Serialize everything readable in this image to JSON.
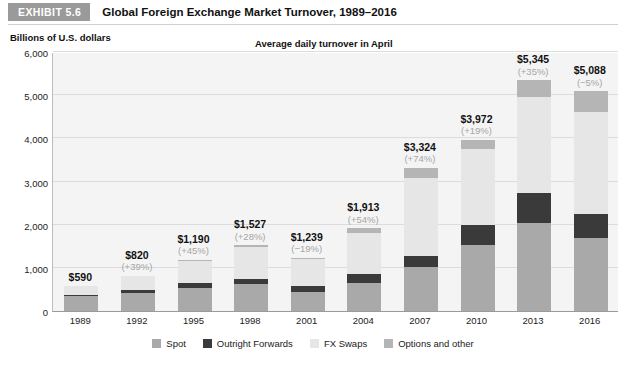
{
  "exhibit": {
    "badge": "EXHIBIT 5.6",
    "title": "Global Foreign Exchange Market Turnover, 1989–2016"
  },
  "chart_data": {
    "type": "bar",
    "stacked": true,
    "title": "Global Foreign Exchange Market Turnover, 1989–2016",
    "subtitle": "Average daily turnover in April",
    "ylabel": "Billions of U.S. dollars",
    "xlabel": "",
    "ylim": [
      0,
      6000
    ],
    "yticks": [
      0,
      1000,
      2000,
      3000,
      4000,
      5000,
      6000
    ],
    "ytick_labels": [
      "0",
      "1,000",
      "2,000",
      "3,000",
      "4,000",
      "5,000",
      "6,000"
    ],
    "grid": true,
    "legend_position": "bottom",
    "categories": [
      "1989",
      "1992",
      "1995",
      "1998",
      "2001",
      "2004",
      "2007",
      "2010",
      "2013",
      "2016"
    ],
    "series": [
      {
        "name": "Spot",
        "color": "#a9a9a9",
        "values": [
          350,
          420,
          540,
          620,
          440,
          660,
          1030,
          1520,
          2050,
          1680
        ]
      },
      {
        "name": "Outright Forwards",
        "color": "#3a3a3a",
        "values": [
          30,
          60,
          100,
          130,
          140,
          190,
          240,
          480,
          680,
          560
        ]
      },
      {
        "name": "FX Swaps",
        "color": "#e6e6e6",
        "values": [
          190,
          320,
          520,
          730,
          630,
          950,
          1810,
          1760,
          2230,
          2380
        ]
      },
      {
        "name": "Options and other",
        "color": "#b5b5b5",
        "values": [
          20,
          20,
          30,
          47,
          29,
          113,
          244,
          212,
          385,
          468
        ]
      }
    ],
    "totals": [
      590,
      820,
      1190,
      1527,
      1239,
      1913,
      3324,
      3972,
      5345,
      5088
    ],
    "total_labels": [
      "$590",
      "$820",
      "$1,190",
      "$1,527",
      "$1,239",
      "$1,913",
      "$3,324",
      "$3,972",
      "$5,345",
      "$5,088"
    ],
    "change_labels": [
      "",
      "(+39%)",
      "(+45%)",
      "(+28%)",
      "(−19%)",
      "(+54%)",
      "(+74%)",
      "(+19%)",
      "(+35%)",
      "(−5%)"
    ]
  },
  "colors": {
    "badge_bg": "#9a9a9a",
    "plot_bg": "#f4f4f4",
    "gridline": "#dcdcdc",
    "axis": "#9a9a9a",
    "delta_text": "#a6a6a6"
  }
}
